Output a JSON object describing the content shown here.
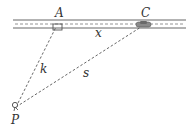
{
  "diagram": {
    "type": "geometry",
    "labels": {
      "A": "A",
      "C": "C",
      "P": "P",
      "x": "x",
      "k": "k",
      "s": "s"
    },
    "colors": {
      "line": "#555555",
      "text": "#333333",
      "car": "#777777",
      "background": "#ffffff"
    },
    "elements": {
      "road": {
        "from": "left",
        "to": "right",
        "has_center_dashed_line": true
      },
      "right_angle_at": "A",
      "car_at": "C",
      "segments": [
        {
          "from": "P",
          "to": "A",
          "label": "k",
          "style": "dashed"
        },
        {
          "from": "P",
          "to": "C",
          "label": "s",
          "style": "dashed"
        },
        {
          "from": "A",
          "to": "C",
          "label": "x",
          "style": "along-road"
        }
      ]
    }
  }
}
